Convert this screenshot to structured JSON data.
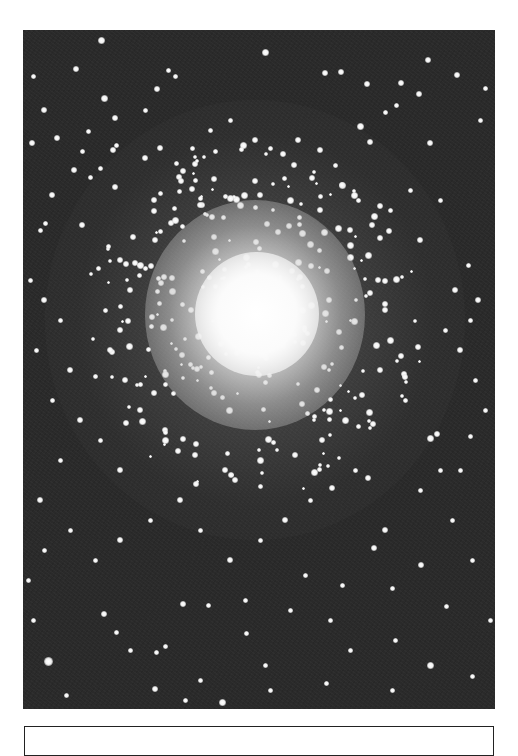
{
  "figure": {
    "style": "black-and-white astrophotograph",
    "background_color": "#2a2a2a",
    "star_color": "#ffffff",
    "core_center": [
      255,
      320
    ],
    "caption": ""
  },
  "stars": [
    [
      48,
      661,
      9
    ],
    [
      101,
      40,
      7
    ],
    [
      265,
      52,
      7
    ],
    [
      428,
      60,
      6
    ],
    [
      341,
      72,
      6
    ],
    [
      76,
      69,
      6
    ],
    [
      175,
      76,
      5
    ],
    [
      457,
      75,
      6
    ],
    [
      104,
      98,
      7
    ],
    [
      401,
      83,
      6
    ],
    [
      419,
      94,
      6
    ],
    [
      396,
      105,
      5
    ],
    [
      325,
      73,
      6
    ],
    [
      367,
      84,
      6
    ],
    [
      385,
      112,
      5
    ],
    [
      430,
      143,
      6
    ],
    [
      360,
      126,
      7
    ],
    [
      370,
      142,
      6
    ],
    [
      485,
      88,
      5
    ],
    [
      480,
      120,
      5
    ],
    [
      44,
      110,
      6
    ],
    [
      57,
      138,
      6
    ],
    [
      33,
      76,
      5
    ],
    [
      82,
      151,
      5
    ],
    [
      88,
      131,
      5
    ],
    [
      115,
      118,
      6
    ],
    [
      168,
      70,
      5
    ],
    [
      157,
      89,
      6
    ],
    [
      145,
      110,
      5
    ],
    [
      116,
      145,
      5
    ],
    [
      32,
      143,
      6
    ],
    [
      113,
      150,
      6
    ],
    [
      100,
      168,
      5
    ],
    [
      74,
      170,
      6
    ],
    [
      90,
      177,
      5
    ],
    [
      52,
      195,
      6
    ],
    [
      40,
      230,
      5
    ],
    [
      45,
      223,
      5
    ],
    [
      82,
      225,
      6
    ],
    [
      115,
      187,
      6
    ],
    [
      145,
      158,
      6
    ],
    [
      160,
      148,
      6
    ],
    [
      176,
      163,
      5
    ],
    [
      192,
      148,
      5
    ],
    [
      210,
      130,
      5
    ],
    [
      230,
      120,
      5
    ],
    [
      255,
      140,
      6
    ],
    [
      298,
      140,
      6
    ],
    [
      320,
      150,
      6
    ],
    [
      335,
      165,
      5
    ],
    [
      342,
      185,
      6
    ],
    [
      358,
      200,
      5
    ],
    [
      372,
      225,
      6
    ],
    [
      390,
      210,
      5
    ],
    [
      410,
      190,
      5
    ],
    [
      420,
      240,
      6
    ],
    [
      440,
      200,
      5
    ],
    [
      468,
      265,
      5
    ],
    [
      455,
      290,
      6
    ],
    [
      470,
      320,
      5
    ],
    [
      478,
      300,
      6
    ],
    [
      30,
      280,
      5
    ],
    [
      44,
      300,
      6
    ],
    [
      60,
      320,
      5
    ],
    [
      36,
      350,
      5
    ],
    [
      70,
      370,
      6
    ],
    [
      52,
      400,
      5
    ],
    [
      80,
      420,
      6
    ],
    [
      100,
      440,
      5
    ],
    [
      120,
      470,
      6
    ],
    [
      60,
      460,
      5
    ],
    [
      40,
      500,
      6
    ],
    [
      70,
      530,
      5
    ],
    [
      95,
      560,
      5
    ],
    [
      120,
      540,
      6
    ],
    [
      150,
      520,
      5
    ],
    [
      180,
      500,
      6
    ],
    [
      200,
      530,
      5
    ],
    [
      230,
      560,
      6
    ],
    [
      260,
      540,
      5
    ],
    [
      285,
      520,
      6
    ],
    [
      310,
      500,
      5
    ],
    [
      332,
      488,
      6
    ],
    [
      355,
      470,
      5
    ],
    [
      368,
      478,
      6
    ],
    [
      385,
      530,
      6
    ],
    [
      420,
      490,
      5
    ],
    [
      440,
      470,
      5
    ],
    [
      430,
      438,
      7
    ],
    [
      437,
      434,
      6
    ],
    [
      470,
      436,
      5
    ],
    [
      460,
      470,
      5
    ],
    [
      452,
      520,
      5
    ],
    [
      472,
      560,
      5
    ],
    [
      490,
      620,
      5
    ],
    [
      374,
      548,
      6
    ],
    [
      392,
      588,
      5
    ],
    [
      421,
      565,
      6
    ],
    [
      395,
      640,
      5
    ],
    [
      446,
      606,
      5
    ],
    [
      430,
      665,
      7
    ],
    [
      472,
      676,
      5
    ],
    [
      392,
      690,
      5
    ],
    [
      326,
      683,
      5
    ],
    [
      265,
      665,
      5
    ],
    [
      104,
      614,
      6
    ],
    [
      130,
      650,
      5
    ],
    [
      155,
      689,
      6
    ],
    [
      185,
      700,
      5
    ],
    [
      200,
      680,
      5
    ],
    [
      222,
      702,
      7
    ],
    [
      165,
      646,
      5
    ],
    [
      156,
      652,
      5
    ],
    [
      116,
      632,
      5
    ],
    [
      183,
      604,
      6
    ],
    [
      208,
      605,
      5
    ],
    [
      245,
      600,
      5
    ],
    [
      290,
      610,
      5
    ],
    [
      330,
      620,
      5
    ],
    [
      350,
      650,
      5
    ],
    [
      270,
      690,
      5
    ],
    [
      305,
      575,
      5
    ],
    [
      342,
      585,
      5
    ],
    [
      246,
      633,
      5
    ],
    [
      66,
      695,
      5
    ],
    [
      33,
      620,
      5
    ],
    [
      28,
      580,
      5
    ],
    [
      44,
      550,
      5
    ],
    [
      475,
      380,
      5
    ],
    [
      485,
      410,
      5
    ],
    [
      460,
      350,
      6
    ],
    [
      445,
      330,
      5
    ],
    [
      120,
      260,
      6
    ],
    [
      130,
      290,
      6
    ],
    [
      105,
      310,
      5
    ],
    [
      110,
      350,
      6
    ],
    [
      125,
      380,
      6
    ],
    [
      140,
      410,
      6
    ],
    [
      165,
      440,
      7
    ],
    [
      195,
      455,
      6
    ],
    [
      225,
      470,
      6
    ],
    [
      260,
      460,
      7
    ],
    [
      295,
      455,
      6
    ],
    [
      322,
      440,
      6
    ],
    [
      345,
      420,
      7
    ],
    [
      362,
      395,
      6
    ],
    [
      380,
      370,
      6
    ],
    [
      390,
      340,
      7
    ],
    [
      385,
      310,
      6
    ],
    [
      378,
      280,
      6
    ],
    [
      368,
      255,
      7
    ],
    [
      350,
      230,
      6
    ],
    [
      320,
      210,
      6
    ],
    [
      290,
      200,
      7
    ],
    [
      260,
      195,
      6
    ],
    [
      230,
      198,
      7
    ],
    [
      200,
      205,
      6
    ],
    [
      175,
      220,
      7
    ],
    [
      155,
      240,
      6
    ],
    [
      140,
      265,
      7
    ]
  ],
  "cluster_members": {
    "count": 320,
    "center": [
      255,
      320
    ],
    "radius": 170,
    "seed": 7
  },
  "caption_box": {
    "text": ""
  }
}
